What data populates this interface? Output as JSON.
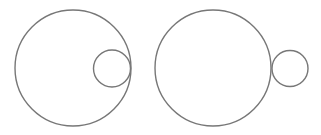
{
  "diagram": {
    "stroke_color": "#777777",
    "background": "#ffffff",
    "figures": [
      {
        "name": "internally-tangent-circles",
        "large": {
          "cx": 73,
          "cy": 68,
          "r": 58
        },
        "small": {
          "cx": 112,
          "cy": 68.5,
          "r": 18.5
        }
      },
      {
        "name": "externally-tangent-circles",
        "large": {
          "cx": 213,
          "cy": 68,
          "r": 58
        },
        "small": {
          "cx": 290,
          "cy": 68.5,
          "r": 18
        }
      }
    ]
  }
}
